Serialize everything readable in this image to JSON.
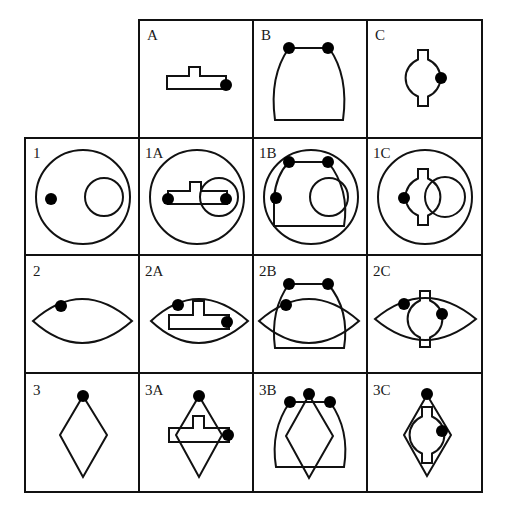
{
  "diagram": {
    "type": "overlay-combination-grid",
    "columns": [
      "",
      "A",
      "B",
      "C"
    ],
    "rows": [
      "",
      "1",
      "2",
      "3"
    ],
    "cells": {
      "A": {
        "label": "A",
        "shape": "t-shaped bar with one dot at right end"
      },
      "B": {
        "label": "B",
        "shape": "bell / arch shape with two dots at top corners"
      },
      "C": {
        "label": "C",
        "shape": "circle with top and bottom tabs, dot on right side"
      },
      "1": {
        "label": "1",
        "shape": "large circle containing small circle on right and dot on left"
      },
      "1A": {
        "label": "1A",
        "shape": "1 overlaid with A"
      },
      "1B": {
        "label": "1B",
        "shape": "1 overlaid with B"
      },
      "1C": {
        "label": "1C",
        "shape": "1 overlaid with C"
      },
      "2": {
        "label": "2",
        "shape": "lens / eye shape with dot on upper-left edge"
      },
      "2A": {
        "label": "2A",
        "shape": "2 overlaid with A"
      },
      "2B": {
        "label": "2B",
        "shape": "2 overlaid with B"
      },
      "2C": {
        "label": "2C",
        "shape": "2 overlaid with C"
      },
      "3": {
        "label": "3",
        "shape": "diamond with dot at top vertex"
      },
      "3A": {
        "label": "3A",
        "shape": "3 overlaid with A"
      },
      "3B": {
        "label": "3B",
        "shape": "3 overlaid with B"
      },
      "3C": {
        "label": "3C",
        "shape": "3 overlaid with C"
      }
    }
  }
}
